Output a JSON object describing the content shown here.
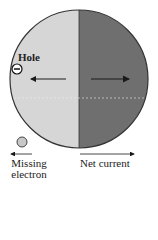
{
  "diagram": {
    "labels": {
      "hole": "Hole",
      "missing_line1": "Missing",
      "missing_line2": "electron",
      "net_current": "Net current"
    },
    "hole_symbol": "−",
    "colors": {
      "left_half": "#d6d6d6",
      "right_half": "#6f6f6f",
      "outline": "#333333",
      "arrow": "#1a1a1a",
      "missing_electron_fill": "#c8c8c8"
    },
    "arrows": [
      {
        "name": "electron-motion",
        "direction": "left"
      },
      {
        "name": "hole-motion",
        "direction": "right"
      },
      {
        "name": "missing-electron",
        "direction": "left"
      },
      {
        "name": "net-current",
        "direction": "right"
      }
    ]
  }
}
